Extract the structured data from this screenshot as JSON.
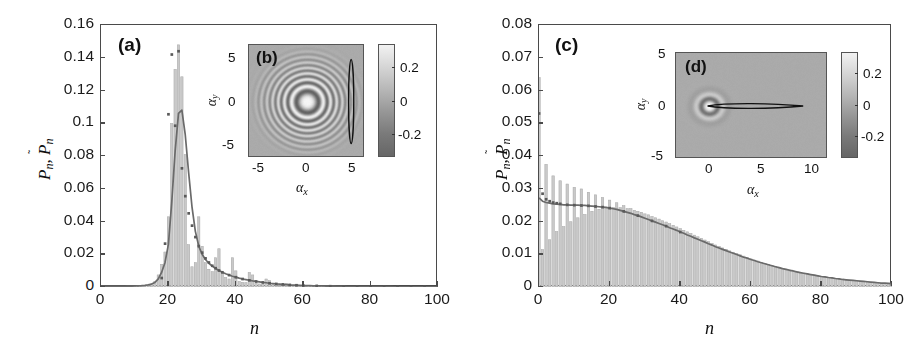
{
  "figure": {
    "type": "two-panel scientific figure"
  },
  "panels": {
    "a": {
      "tag": "(a)",
      "ylabel": "P_n, P̃_n",
      "xlabel": "n",
      "yticks": [
        "0",
        "0.02",
        "0.04",
        "0.06",
        "0.08",
        "0.1",
        "0.12",
        "0.14",
        "0.16"
      ],
      "ytick_values": [
        0,
        0.02,
        0.04,
        0.06,
        0.08,
        0.1,
        0.12,
        0.14,
        0.16
      ],
      "xticks": [
        "0",
        "20",
        "40",
        "60",
        "80",
        "100"
      ],
      "xtick_values": [
        0,
        20,
        40,
        60,
        80,
        100
      ]
    },
    "b": {
      "tag": "(b)",
      "xlabel": "α_x",
      "ylabel": "α_y",
      "xticks": [
        "-5",
        "0",
        "5"
      ],
      "xtick_values": [
        -5,
        0,
        5
      ],
      "yticks": [
        "5",
        "0",
        "-5"
      ],
      "ytick_values": [
        5,
        0,
        -5
      ],
      "cbar_ticks": [
        "0.2",
        "0",
        "-0.2"
      ],
      "cbar_tick_values": [
        0.2,
        0,
        -0.2
      ],
      "cbar_range": [
        -0.3,
        0.3
      ],
      "xlim": [
        -6.2,
        6.2
      ],
      "ylim": [
        -6.2,
        6.2
      ]
    },
    "c": {
      "tag": "(c)",
      "ylabel": "P_n, P̃_n",
      "xlabel": "n",
      "yticks": [
        "0",
        "0.01",
        "0.02",
        "0.03",
        "0.04",
        "0.05",
        "0.06",
        "0.07",
        "0.08"
      ],
      "ytick_values": [
        0,
        0.01,
        0.02,
        0.03,
        0.04,
        0.05,
        0.06,
        0.07,
        0.08
      ],
      "xticks": [
        "0",
        "20",
        "40",
        "60",
        "80",
        "100"
      ],
      "xtick_values": [
        0,
        20,
        40,
        60,
        80,
        100
      ]
    },
    "d": {
      "tag": "(d)",
      "xlabel": "α_x",
      "ylabel": "α_y",
      "xticks": [
        "0",
        "5",
        "10"
      ],
      "xtick_values": [
        0,
        5,
        10
      ],
      "yticks": [
        "5",
        "0",
        "-5"
      ],
      "ytick_values": [
        5,
        0,
        -5
      ],
      "cbar_ticks": [
        "0.2",
        "0",
        "-0.2"
      ],
      "cbar_tick_values": [
        0.2,
        0,
        -0.2
      ],
      "cbar_range": [
        -0.3,
        0.3
      ],
      "xlim": [
        -3.2,
        11.5
      ],
      "ylim": [
        -5.6,
        5.6
      ]
    }
  },
  "colors": {
    "bar_fill": "#c9c9c9",
    "bar_edge": "#b0b0b0",
    "curve": "#6a6a6a",
    "marker": "#5a5a5a",
    "axis": "#4a4a4a",
    "text": "#111111",
    "inset_bg": "#9a9a9a",
    "contour": "#111111"
  },
  "chart_data": [
    {
      "type": "bar",
      "id": "panel-a-histogram",
      "title": "(a)",
      "xlabel": "n",
      "ylabel": "P_n, P̃_n",
      "xlim": [
        0,
        100
      ],
      "ylim": [
        0,
        0.16
      ],
      "grid": false,
      "legend": null,
      "x": [
        0,
        1,
        2,
        3,
        4,
        5,
        6,
        7,
        8,
        9,
        10,
        11,
        12,
        13,
        14,
        15,
        16,
        17,
        18,
        19,
        20,
        21,
        22,
        23,
        24,
        25,
        26,
        27,
        28,
        29,
        30,
        31,
        32,
        33,
        34,
        35,
        36,
        37,
        38,
        39,
        40,
        41,
        42,
        43,
        44,
        45,
        46,
        47,
        48,
        49,
        50,
        51,
        52,
        53,
        54,
        55,
        56,
        57,
        58,
        59,
        60,
        61,
        62,
        63,
        64,
        65,
        66,
        67,
        68,
        69,
        70,
        71,
        72,
        73,
        74,
        75,
        76,
        77,
        78,
        79,
        80,
        81,
        82,
        83,
        84,
        85,
        86,
        87,
        88,
        89,
        90,
        91,
        92,
        93,
        94,
        95,
        96,
        97,
        98,
        99,
        100
      ],
      "series": [
        {
          "name": "P_n (bars)",
          "style": "bar",
          "values": [
            0.0005,
            0.0005,
            0.0005,
            0.0005,
            0.0005,
            0.0005,
            0.0005,
            0.0005,
            0.0005,
            0.0005,
            0.0006,
            0.0007,
            0.0008,
            0.001,
            0.0014,
            0.002,
            0.0035,
            0.0075,
            0.014,
            0.0215,
            0.043,
            0.1,
            0.133,
            0.148,
            0.1285,
            0.081,
            0.026,
            0.0125,
            0.015,
            0.043,
            0.025,
            0.015,
            0.011,
            0.0095,
            0.018,
            0.0235,
            0.0085,
            0.006,
            0.005,
            0.018,
            0.01,
            0.0035,
            0.003,
            0.0028,
            0.009,
            0.0075,
            0.0025,
            0.002,
            0.0018,
            0.005,
            0.004,
            0.0015,
            0.0012,
            0.001,
            0.002,
            0.0022,
            0.001,
            0.0008,
            0.0007,
            0.001,
            0.0009,
            0.0006,
            0.0005,
            0.0005,
            0.0006,
            0.0006,
            0.0005,
            0.0004,
            0.0004,
            0.0005,
            0.0004,
            0.0003,
            0.0003,
            0.0003,
            0.0004,
            0.0004,
            0.0003,
            0.0003,
            0.0003,
            0.0003,
            0.0003,
            0.0002,
            0.0002,
            0.0002,
            0.0003,
            0.0003,
            0.0002,
            0.0002,
            0.0002,
            0.0002,
            0.0002,
            0.0002,
            0.0002,
            0.0002,
            0.0002,
            0.0002,
            0.0002,
            0.0002,
            0.0002,
            0.0002,
            0.0002
          ]
        },
        {
          "name": "P̃_n (smooth curve)",
          "style": "line",
          "values": [
            0.0004,
            0.0004,
            0.0004,
            0.0004,
            0.0004,
            0.0004,
            0.0004,
            0.0004,
            0.0005,
            0.0005,
            0.0006,
            0.0007,
            0.0008,
            0.001,
            0.0013,
            0.0018,
            0.0028,
            0.005,
            0.009,
            0.015,
            0.026,
            0.052,
            0.083,
            0.106,
            0.108,
            0.093,
            0.07,
            0.049,
            0.034,
            0.025,
            0.02,
            0.0168,
            0.0145,
            0.0128,
            0.0113,
            0.0101,
            0.009,
            0.0081,
            0.0073,
            0.0066,
            0.006,
            0.0054,
            0.0049,
            0.0045,
            0.0041,
            0.0037,
            0.0034,
            0.0031,
            0.0028,
            0.0026,
            0.0023,
            0.0021,
            0.0019,
            0.0018,
            0.0016,
            0.0015,
            0.0013,
            0.0012,
            0.0011,
            0.001,
            0.0009,
            0.0009,
            0.0008,
            0.0007,
            0.0007,
            0.0006,
            0.0006,
            0.0005,
            0.0005,
            0.0005,
            0.0004,
            0.0004,
            0.0004,
            0.0003,
            0.0003,
            0.0003,
            0.0003,
            0.0003,
            0.0002,
            0.0002,
            0.0002,
            0.0002,
            0.0002,
            0.0002,
            0.0002,
            0.0002,
            0.0002,
            0.0001,
            0.0001,
            0.0001,
            0.0001,
            0.0001,
            0.0001,
            0.0001,
            0.0001,
            0.0001,
            0.0001,
            0.0001,
            0.0001,
            0.0001,
            0.0001
          ]
        },
        {
          "name": "P̃_n (markers)",
          "style": "scatter",
          "x": [
            18,
            19,
            20,
            21,
            22,
            23,
            24,
            25,
            26,
            27,
            28,
            29,
            30,
            31,
            32,
            33,
            34,
            35,
            36,
            38,
            40,
            42,
            44,
            46,
            48,
            50,
            52,
            54,
            56,
            58,
            60,
            64,
            68,
            72,
            76,
            80,
            84,
            88,
            92,
            96,
            100
          ],
          "values": [
            0.0055,
            0.0265,
            0.1055,
            0.142,
            0.0985,
            0.144,
            0.0725,
            0.0555,
            0.045,
            0.0375,
            0.0305,
            0.025,
            0.021,
            0.0175,
            0.015,
            0.013,
            0.0115,
            0.0101,
            0.009,
            0.0073,
            0.006,
            0.0049,
            0.0041,
            0.0034,
            0.0028,
            0.0023,
            0.0019,
            0.0016,
            0.0013,
            0.0011,
            0.0009,
            0.0007,
            0.0005,
            0.0004,
            0.0003,
            0.0002,
            0.0002,
            0.0001,
            0.0001,
            0.0001,
            0.0001
          ]
        }
      ]
    },
    {
      "type": "bar",
      "id": "panel-c-histogram",
      "title": "(c)",
      "xlabel": "n",
      "ylabel": "P_n, P̃_n",
      "xlim": [
        0,
        100
      ],
      "ylim": [
        0,
        0.08
      ],
      "grid": false,
      "legend": null,
      "x": [
        0,
        1,
        2,
        3,
        4,
        5,
        6,
        7,
        8,
        9,
        10,
        11,
        12,
        13,
        14,
        15,
        16,
        17,
        18,
        19,
        20,
        21,
        22,
        23,
        24,
        25,
        26,
        27,
        28,
        29,
        30,
        31,
        32,
        33,
        34,
        35,
        36,
        37,
        38,
        39,
        40,
        41,
        42,
        43,
        44,
        45,
        46,
        47,
        48,
        49,
        50,
        51,
        52,
        53,
        54,
        55,
        56,
        57,
        58,
        59,
        60,
        61,
        62,
        63,
        64,
        65,
        66,
        67,
        68,
        69,
        70,
        71,
        72,
        73,
        74,
        75,
        76,
        77,
        78,
        79,
        80,
        81,
        82,
        83,
        84,
        85,
        86,
        87,
        88,
        89,
        90,
        91,
        92,
        93,
        94,
        95,
        96,
        97,
        98,
        99,
        100
      ],
      "series": [
        {
          "name": "P_n (bars)",
          "style": "bar",
          "values": [
            0.064,
            0.0115,
            0.0375,
            0.0145,
            0.034,
            0.017,
            0.0325,
            0.0185,
            0.0315,
            0.02,
            0.0305,
            0.0212,
            0.03,
            0.0222,
            0.029,
            0.0232,
            0.0282,
            0.0238,
            0.0274,
            0.0242,
            0.0266,
            0.0244,
            0.0258,
            0.0243,
            0.0249,
            0.024,
            0.024,
            0.0235,
            0.0232,
            0.0229,
            0.0224,
            0.0221,
            0.0216,
            0.0212,
            0.0208,
            0.0203,
            0.0199,
            0.0194,
            0.0189,
            0.0184,
            0.0179,
            0.0174,
            0.0169,
            0.0164,
            0.0159,
            0.0154,
            0.0149,
            0.0144,
            0.0139,
            0.0134,
            0.0129,
            0.0125,
            0.012,
            0.0116,
            0.0111,
            0.0107,
            0.0103,
            0.0099,
            0.0095,
            0.0091,
            0.0087,
            0.0083,
            0.008,
            0.0076,
            0.0073,
            0.007,
            0.0067,
            0.0064,
            0.0061,
            0.0058,
            0.0055,
            0.0053,
            0.005,
            0.0048,
            0.0045,
            0.0043,
            0.0041,
            0.0039,
            0.0037,
            0.0035,
            0.0033,
            0.0031,
            0.003,
            0.0028,
            0.0027,
            0.0025,
            0.0024,
            0.0022,
            0.0021,
            0.002,
            0.0019,
            0.0018,
            0.0017,
            0.0016,
            0.0015,
            0.0014,
            0.0013,
            0.0012,
            0.0012,
            0.0011,
            0.001
          ]
        },
        {
          "name": "P̃_n (smooth curve)",
          "style": "line",
          "values": [
            0.0272,
            0.0262,
            0.0258,
            0.0256,
            0.0254,
            0.0253,
            0.0252,
            0.0251,
            0.0251,
            0.025,
            0.025,
            0.025,
            0.0249,
            0.0249,
            0.0248,
            0.0247,
            0.0246,
            0.0245,
            0.0244,
            0.0243,
            0.0241,
            0.0239,
            0.0237,
            0.0234,
            0.0231,
            0.0228,
            0.0225,
            0.0221,
            0.0218,
            0.0214,
            0.021,
            0.0206,
            0.0202,
            0.0198,
            0.0194,
            0.019,
            0.0186,
            0.0181,
            0.0177,
            0.0173,
            0.0168,
            0.0164,
            0.0159,
            0.0155,
            0.015,
            0.0146,
            0.0141,
            0.0137,
            0.0132,
            0.0128,
            0.0123,
            0.0119,
            0.0115,
            0.0111,
            0.0107,
            0.0103,
            0.0099,
            0.0095,
            0.0091,
            0.0088,
            0.0084,
            0.0081,
            0.0077,
            0.0074,
            0.0071,
            0.0068,
            0.0065,
            0.0062,
            0.0059,
            0.0056,
            0.0054,
            0.0051,
            0.0049,
            0.0046,
            0.0044,
            0.0042,
            0.004,
            0.0038,
            0.0036,
            0.0034,
            0.0032,
            0.0031,
            0.0029,
            0.0028,
            0.0026,
            0.0025,
            0.0023,
            0.0022,
            0.0021,
            0.002,
            0.0019,
            0.0018,
            0.0017,
            0.0016,
            0.0015,
            0.0014,
            0.0013,
            0.0012,
            0.0012,
            0.0011,
            0.001
          ]
        },
        {
          "name": "P̃_n (markers)",
          "style": "scatter",
          "x": [
            0,
            1,
            2,
            3,
            4,
            5,
            6,
            8,
            10,
            12,
            14,
            16,
            18,
            20,
            24,
            28,
            32,
            36,
            40
          ],
          "values": [
            0.053,
            0.0285,
            0.0268,
            0.0262,
            0.0258,
            0.0256,
            0.0254,
            0.0251,
            0.025,
            0.0249,
            0.0248,
            0.0246,
            0.0244,
            0.0241,
            0.0231,
            0.0218,
            0.0202,
            0.0186,
            0.0168
          ]
        }
      ]
    }
  ]
}
